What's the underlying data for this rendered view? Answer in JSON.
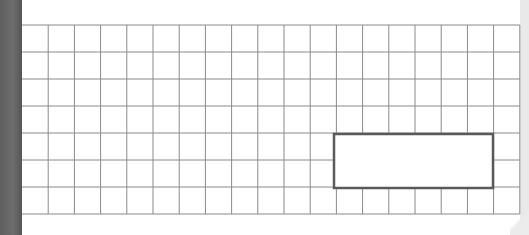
{
  "diagram": {
    "type": "grid-paper",
    "grid": {
      "columns": 19,
      "rows": 7,
      "origin_x": 22,
      "origin_y": 25,
      "cell_width": 26.2,
      "cell_height": 27,
      "line_color": "#8a8a8a"
    },
    "highlight_rectangle": {
      "x": 334,
      "y": 134,
      "width": 159,
      "height": 54,
      "stroke_color": "#5a5a5a",
      "stroke_width": 2.5
    },
    "colors": {
      "background": "#ffffff",
      "left_binding": "#636363",
      "right_edge": "#e9e9e9"
    }
  }
}
